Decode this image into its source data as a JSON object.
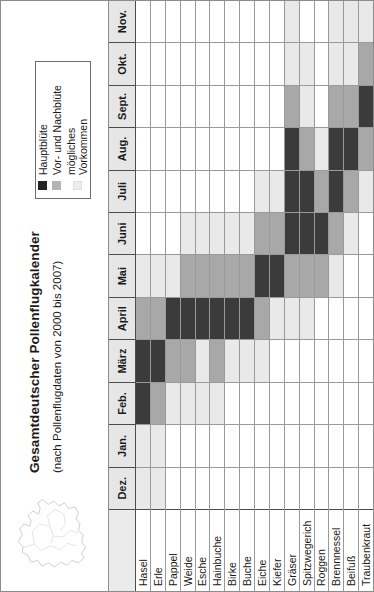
{
  "figure": {
    "title": "Gesamtdeutscher Pollenflugkalender",
    "subtitle": "(nach Pollenflugdaten von 2000 bis 2007)",
    "map_icon": "germany-outline-map"
  },
  "legend": {
    "items": [
      {
        "label": "Hauptblüte",
        "color": "#3b3b3b",
        "level": 3
      },
      {
        "label": "Vor- und Nachblüte",
        "color": "#a8a8a8",
        "level": 2
      },
      {
        "label": "mögliches Vorkommen",
        "color": "#e9e9e9",
        "level": 1
      }
    ]
  },
  "chart_data": {
    "type": "heatmap",
    "title": "Gesamtdeutscher Pollenflugkalender",
    "subtitle": "(nach Pollenflugdaten von 2000 bis 2007)",
    "xlabel": "",
    "ylabel": "",
    "grid": true,
    "legend_position": "top-right",
    "value_scale": {
      "0": "kein Vorkommen",
      "1": "mögliches Vorkommen",
      "2": "Vor- und Nachblüte",
      "3": "Hauptblüte"
    },
    "colors": {
      "0": "#ffffff",
      "1": "#e9e9e9",
      "2": "#a8a8a8",
      "3": "#3b3b3b"
    },
    "categories": [
      "Dez.",
      "Jan.",
      "Feb.",
      "März",
      "April",
      "Mai",
      "Juni",
      "Juli",
      "Aug.",
      "Sept.",
      "Okt.",
      "Nov."
    ],
    "rows": [
      {
        "name": "Hasel",
        "values": [
          1,
          1,
          3,
          3,
          2,
          1,
          0,
          0,
          0,
          0,
          0,
          0
        ]
      },
      {
        "name": "Erle",
        "values": [
          1,
          1,
          2,
          3,
          2,
          1,
          0,
          0,
          0,
          0,
          0,
          0
        ]
      },
      {
        "name": "Pappel",
        "values": [
          0,
          0,
          1,
          2,
          3,
          1,
          0,
          0,
          0,
          0,
          0,
          0
        ]
      },
      {
        "name": "Weide",
        "values": [
          0,
          0,
          1,
          2,
          3,
          2,
          1,
          0,
          0,
          0,
          0,
          0
        ]
      },
      {
        "name": "Esche",
        "values": [
          0,
          0,
          1,
          1,
          3,
          2,
          1,
          0,
          0,
          0,
          0,
          0
        ]
      },
      {
        "name": "Hainbuche",
        "values": [
          0,
          0,
          1,
          2,
          3,
          2,
          1,
          0,
          0,
          0,
          0,
          0
        ]
      },
      {
        "name": "Birke",
        "values": [
          0,
          0,
          0,
          1,
          3,
          2,
          1,
          0,
          0,
          0,
          0,
          0
        ]
      },
      {
        "name": "Buche",
        "values": [
          0,
          0,
          0,
          1,
          3,
          2,
          1,
          0,
          0,
          0,
          0,
          0
        ]
      },
      {
        "name": "Eiche",
        "values": [
          0,
          0,
          0,
          1,
          2,
          3,
          2,
          1,
          0,
          0,
          0,
          0
        ]
      },
      {
        "name": "Kiefer",
        "values": [
          0,
          0,
          0,
          0,
          1,
          3,
          2,
          1,
          0,
          0,
          0,
          0
        ]
      },
      {
        "name": "Gräser",
        "values": [
          0,
          0,
          0,
          0,
          1,
          2,
          3,
          3,
          3,
          2,
          1,
          1
        ]
      },
      {
        "name": "Spitzwegerich",
        "values": [
          0,
          0,
          0,
          0,
          1,
          2,
          3,
          3,
          2,
          1,
          1,
          0
        ]
      },
      {
        "name": "Roggen",
        "values": [
          0,
          0,
          0,
          0,
          0,
          2,
          3,
          2,
          1,
          0,
          0,
          0
        ]
      },
      {
        "name": "Brennnessel",
        "values": [
          0,
          0,
          0,
          0,
          0,
          1,
          2,
          3,
          3,
          2,
          1,
          1
        ]
      },
      {
        "name": "Beifuß",
        "values": [
          0,
          0,
          0,
          0,
          0,
          0,
          1,
          2,
          3,
          2,
          1,
          1
        ]
      },
      {
        "name": "Traubenkraut",
        "values": [
          0,
          0,
          0,
          0,
          0,
          0,
          0,
          1,
          2,
          3,
          2,
          1
        ]
      }
    ]
  }
}
